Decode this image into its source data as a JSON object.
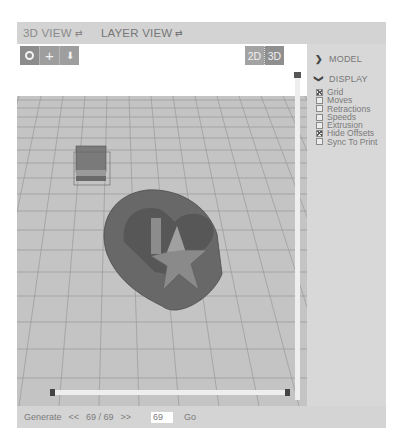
{
  "tabs": [
    {
      "label": "3D VIEW",
      "icon": "⇄",
      "active": false
    },
    {
      "label": "LAYER VIEW",
      "icon": "⇄",
      "active": true
    }
  ],
  "toolbar": {
    "tools": [
      {
        "name": "rotate-tool",
        "icon": "⭘"
      },
      {
        "name": "pan-tool",
        "icon": "+"
      },
      {
        "name": "zoom-tool",
        "icon": "⬇"
      }
    ],
    "dimension": {
      "twoD": "2D",
      "threeD": "3D",
      "active": "3D"
    }
  },
  "sidebar": {
    "model": {
      "label": "MODEL",
      "icon": "›",
      "expanded": false
    },
    "display": {
      "label": "DISPLAY",
      "icon": "⌄",
      "expanded": true,
      "options": [
        {
          "label": "Grid",
          "checked": true
        },
        {
          "label": "Moves",
          "checked": false
        },
        {
          "label": "Retractions",
          "checked": false
        },
        {
          "label": "Speeds",
          "checked": false
        },
        {
          "label": "Extrusion",
          "checked": false
        },
        {
          "label": "Hide Offsets",
          "checked": true
        },
        {
          "label": "Sync To Print",
          "checked": false
        }
      ]
    }
  },
  "bottom": {
    "generate": "Generate",
    "prev": "<<",
    "layer_count": "69 / 69",
    "next": ">>",
    "layer_input": "69",
    "go": "Go"
  },
  "colors": {
    "panel": "#d6d6d6",
    "floor": "#c4c4c4",
    "grid_line": "#9a9a9a",
    "model": "#6e6e6e",
    "slider_handle": "#555555"
  }
}
